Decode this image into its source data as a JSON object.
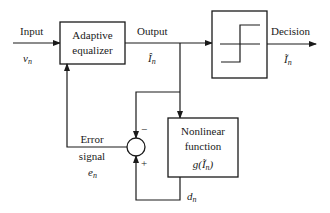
{
  "diagram": {
    "type": "block-diagram",
    "title": "",
    "blocks": {
      "equalizer": {
        "line1": "Adaptive",
        "line2": "equalizer"
      },
      "decision": {
        "symbol": "step-function"
      },
      "nonlinear": {
        "line1": "Nonlinear",
        "line2": "function",
        "line3": "g(Ĩ",
        "line3_sub": "n",
        "line3_end": ")"
      },
      "summer": {
        "minus": "−",
        "plus": "+"
      }
    },
    "signals": {
      "input": {
        "label": "Input",
        "symbol": "v",
        "sub": "n"
      },
      "output": {
        "label": "Output",
        "symbol": "Î",
        "sub": "n"
      },
      "decision": {
        "label": "Decision",
        "symbol": "Ĩ",
        "sub": "n"
      },
      "error": {
        "line1": "Error",
        "line2": "signal",
        "symbol": "e",
        "sub": "n"
      },
      "desired": {
        "symbol": "d",
        "sub": "n"
      }
    },
    "colors": {
      "ink": "#1a1a1a",
      "background": "#ffffff"
    }
  }
}
